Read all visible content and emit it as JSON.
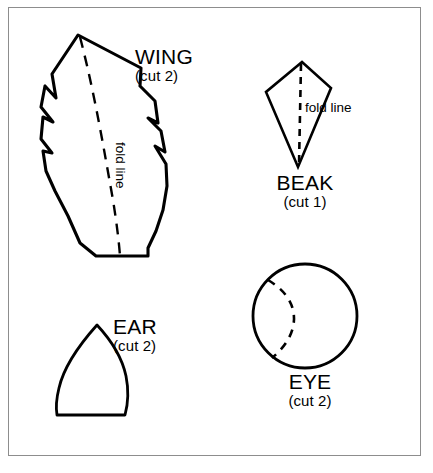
{
  "document": {
    "title": "Craft pattern template sheet",
    "background_color": "#ffffff",
    "ink_color": "#000000",
    "frame_color": "#8d8d8d"
  },
  "pieces": [
    {
      "id": "wing",
      "name": "WING",
      "count_label": "(cut 2)",
      "fold_line_label": "fold line",
      "shape": "jagged feather with flat base",
      "has_fold_line": true
    },
    {
      "id": "beak",
      "name": "BEAK",
      "count_label": "(cut 1)",
      "fold_line_label": "fold line",
      "shape": "kite / diamond",
      "has_fold_line": true
    },
    {
      "id": "ear",
      "name": "EAR",
      "count_label": "(cut 2)",
      "fold_line_label": "",
      "shape": "pointed arch with flat base",
      "has_fold_line": false
    },
    {
      "id": "eye",
      "name": "EYE",
      "count_label": "(cut 2)",
      "fold_line_label": "",
      "shape": "circle with dashed crescent arc",
      "has_fold_line": false
    }
  ]
}
